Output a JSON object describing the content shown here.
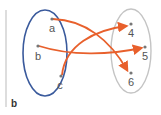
{
  "figure_label": "b",
  "colors": {
    "domain_ellipse": "#3a5a9c",
    "codomain_ellipse": "#c4c4c4",
    "arrow": "#e8602c",
    "point": "#777777",
    "label": "#555555",
    "divider": "#bbbbbb"
  },
  "domain": {
    "name": "domain-set",
    "elements": [
      {
        "label": "a"
      },
      {
        "label": "b"
      },
      {
        "label": "c"
      }
    ]
  },
  "codomain": {
    "name": "codomain-set",
    "elements": [
      {
        "label": "4"
      },
      {
        "label": "5"
      },
      {
        "label": "6"
      }
    ]
  },
  "mappings": [
    {
      "from": "a",
      "to": "6"
    },
    {
      "from": "b",
      "to": "5"
    },
    {
      "from": "c",
      "to": "4"
    }
  ]
}
